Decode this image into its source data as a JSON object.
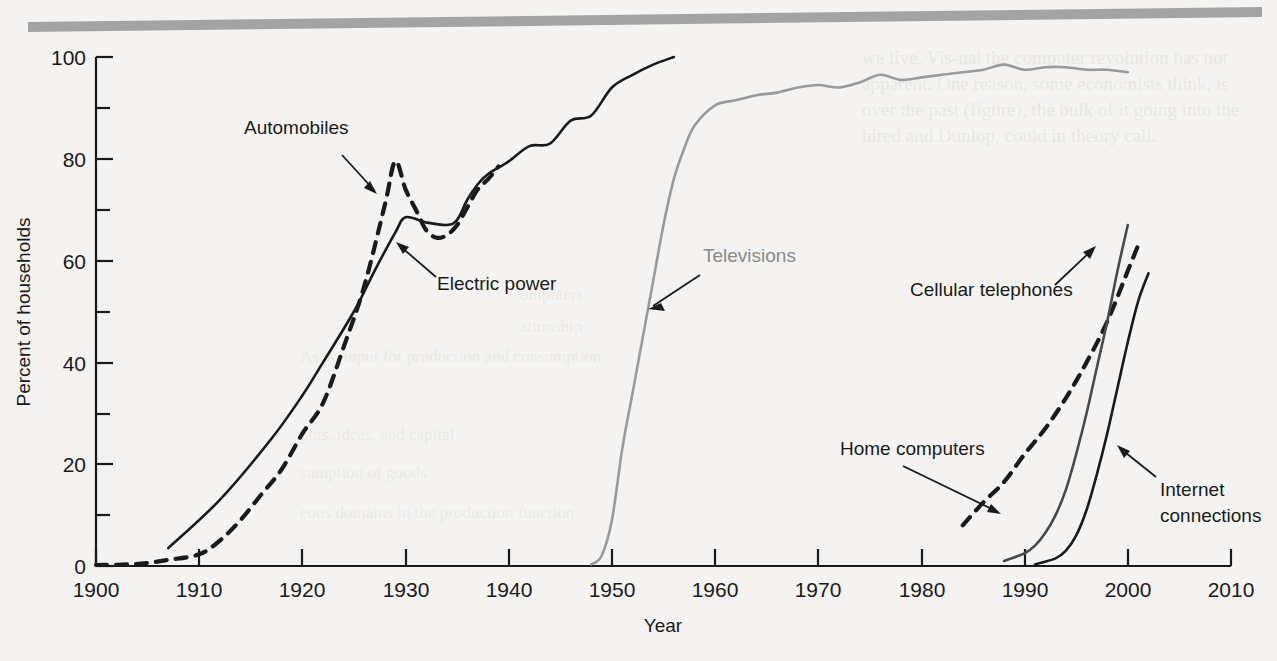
{
  "figure": {
    "background_color": "#f4f3f1",
    "top_rule_color": "#a3a3a3"
  },
  "axes": {
    "x_title": "Year",
    "y_title": "Percent of households",
    "x_ticks": [
      "1900",
      "1910",
      "1920",
      "1930",
      "1940",
      "1950",
      "1960",
      "1970",
      "1980",
      "1990",
      "2000",
      "2010"
    ],
    "y_ticks": [
      "0",
      "20",
      "40",
      "60",
      "80",
      "100"
    ]
  },
  "labels": {
    "automobiles": "Automobiles",
    "electric_power": "Electric power",
    "televisions": "Televisions",
    "cellular_telephones": "Cellular telephones",
    "home_computers": "Home computers",
    "internet_connections": "Internet\nconnections",
    "internet_line1": "Internet",
    "internet_line2": "connections"
  },
  "bleed_text": {
    "lines": [
      "we live. Vis-ual the computer revolution has not",
      "apparent. One reason, some economists think, is",
      "over the past (figure), the bulk of it going into the",
      "hired and Dunlop, could in theory call."
    ],
    "right_block": [
      "omputers",
      "ationship",
      "As an input for production and consumption",
      "",
      "puts, ideas, and capital",
      "sumption of goods",
      "eous domains in the production function"
    ]
  },
  "chart_data": {
    "type": "line",
    "title": "",
    "xlabel": "Year",
    "ylabel": "Percent of households",
    "xlim": [
      1900,
      2010
    ],
    "ylim": [
      0,
      100
    ],
    "grid": false,
    "legend_position": "inline-annotations",
    "series": [
      {
        "name": "Automobiles",
        "style": "dashed",
        "color": "#1a1a1a",
        "points": [
          [
            1900,
            0.2
          ],
          [
            1903,
            0.3
          ],
          [
            1905,
            0.6
          ],
          [
            1907,
            1.2
          ],
          [
            1910,
            2.3
          ],
          [
            1912,
            5.0
          ],
          [
            1914,
            9.0
          ],
          [
            1916,
            14.0
          ],
          [
            1918,
            19.0
          ],
          [
            1920,
            26.0
          ],
          [
            1922,
            32.0
          ],
          [
            1924,
            43.0
          ],
          [
            1926,
            55.0
          ],
          [
            1928,
            71.0
          ],
          [
            1929,
            79.5
          ],
          [
            1930,
            74.0
          ],
          [
            1931,
            70.0
          ],
          [
            1932,
            66.0
          ],
          [
            1933,
            64.5
          ],
          [
            1934,
            65.0
          ],
          [
            1935,
            67.0
          ],
          [
            1936,
            70.5
          ],
          [
            1937,
            74.0
          ],
          [
            1938,
            76.0
          ],
          [
            1939,
            78.5
          ]
        ]
      },
      {
        "name": "Electric power",
        "style": "solid",
        "color": "#1a1a1a",
        "points": [
          [
            1907,
            3.5
          ],
          [
            1912,
            13.0
          ],
          [
            1917,
            25.0
          ],
          [
            1920,
            33.5
          ],
          [
            1922,
            40.0
          ],
          [
            1925,
            50.0
          ],
          [
            1927,
            58.0
          ],
          [
            1929,
            65.5
          ],
          [
            1930,
            68.5
          ],
          [
            1932,
            67.5
          ],
          [
            1934,
            67.0
          ],
          [
            1935,
            68.0
          ],
          [
            1936,
            72.0
          ],
          [
            1937,
            75.0
          ],
          [
            1938,
            77.0
          ],
          [
            1940,
            79.5
          ],
          [
            1942,
            82.5
          ],
          [
            1944,
            83.0
          ],
          [
            1946,
            87.5
          ],
          [
            1948,
            88.5
          ],
          [
            1950,
            94.0
          ],
          [
            1952,
            96.5
          ],
          [
            1954,
            98.5
          ],
          [
            1956,
            100.0
          ]
        ]
      },
      {
        "name": "Televisions",
        "style": "solid",
        "color": "#9a9a9a",
        "points": [
          [
            1948,
            0.3
          ],
          [
            1949,
            2.0
          ],
          [
            1950,
            9.0
          ],
          [
            1951,
            23.0
          ],
          [
            1952,
            34.0
          ],
          [
            1953,
            45.0
          ],
          [
            1954,
            56.0
          ],
          [
            1955,
            67.0
          ],
          [
            1956,
            76.0
          ],
          [
            1957,
            82.0
          ],
          [
            1958,
            86.5
          ],
          [
            1960,
            90.5
          ],
          [
            1962,
            91.5
          ],
          [
            1964,
            92.5
          ],
          [
            1966,
            93.0
          ],
          [
            1968,
            94.0
          ],
          [
            1970,
            94.5
          ],
          [
            1972,
            94.0
          ],
          [
            1974,
            95.0
          ],
          [
            1976,
            96.5
          ],
          [
            1978,
            95.5
          ],
          [
            1980,
            96.0
          ],
          [
            1982,
            96.5
          ],
          [
            1984,
            97.0
          ],
          [
            1986,
            97.5
          ],
          [
            1988,
            98.5
          ],
          [
            1990,
            97.5
          ],
          [
            1992,
            98.0
          ],
          [
            1994,
            98.0
          ],
          [
            1996,
            97.5
          ],
          [
            1998,
            97.5
          ],
          [
            2000,
            97.0
          ]
        ]
      },
      {
        "name": "Home computers",
        "style": "dashed",
        "color": "#1a1a1a",
        "points": [
          [
            1984,
            8.0
          ],
          [
            1986,
            12.5
          ],
          [
            1988,
            16.5
          ],
          [
            1990,
            22.0
          ],
          [
            1992,
            27.0
          ],
          [
            1994,
            33.0
          ],
          [
            1996,
            40.0
          ],
          [
            1998,
            48.0
          ],
          [
            2000,
            58.0
          ],
          [
            2001,
            63.0
          ]
        ]
      },
      {
        "name": "Cellular telephones",
        "style": "solid",
        "color": "#4a4a4a",
        "points": [
          [
            1988,
            1.0
          ],
          [
            1990,
            2.5
          ],
          [
            1991,
            4.0
          ],
          [
            1992,
            6.5
          ],
          [
            1993,
            10.0
          ],
          [
            1994,
            15.0
          ],
          [
            1995,
            22.0
          ],
          [
            1996,
            30.0
          ],
          [
            1997,
            39.0
          ],
          [
            1998,
            48.0
          ],
          [
            1999,
            58.0
          ],
          [
            2000,
            67.0
          ]
        ]
      },
      {
        "name": "Internet connections",
        "style": "solid",
        "color": "#1a1a1a",
        "points": [
          [
            1991,
            0.3
          ],
          [
            1993,
            1.5
          ],
          [
            1994,
            3.0
          ],
          [
            1995,
            6.0
          ],
          [
            1996,
            11.0
          ],
          [
            1997,
            18.0
          ],
          [
            1998,
            26.0
          ],
          [
            1999,
            35.0
          ],
          [
            2000,
            44.0
          ],
          [
            2001,
            52.0
          ],
          [
            2002,
            57.5
          ]
        ]
      }
    ]
  }
}
